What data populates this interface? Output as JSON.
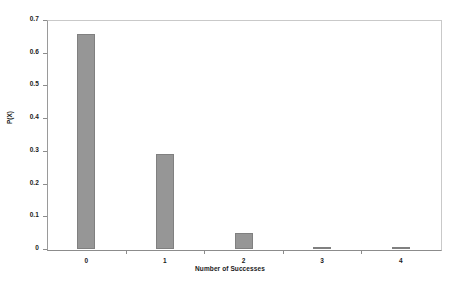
{
  "chart_data": {
    "type": "bar",
    "title": "",
    "subtitle": "",
    "xlabel": "Number of Successes",
    "ylabel": "P(X)",
    "categories": [
      "0",
      "1",
      "2",
      "3",
      "4"
    ],
    "values": [
      0.6561,
      0.2916,
      0.0486,
      0.0036,
      0.0001
    ],
    "series": [
      {
        "name": "P(X)",
        "values": [
          0.6561,
          0.2916,
          0.0486,
          0.0036,
          0.0001
        ]
      }
    ],
    "ylim": [
      0,
      0.7
    ],
    "ytick_labels": [
      "0",
      "0.1",
      "0.2",
      "0.3",
      "0.4",
      "0.5",
      "0.6",
      "0.7"
    ],
    "ytick_values": [
      0,
      0.1,
      0.2,
      0.3,
      0.4,
      0.5,
      0.6,
      0.7
    ],
    "grid": false,
    "legend": "none",
    "bar_color": "#969696",
    "bar_border_color": "#808080",
    "axis_color": "#8c8c8c",
    "frame_color": "#c9c9c9",
    "text_color": "#1a1a1a"
  }
}
